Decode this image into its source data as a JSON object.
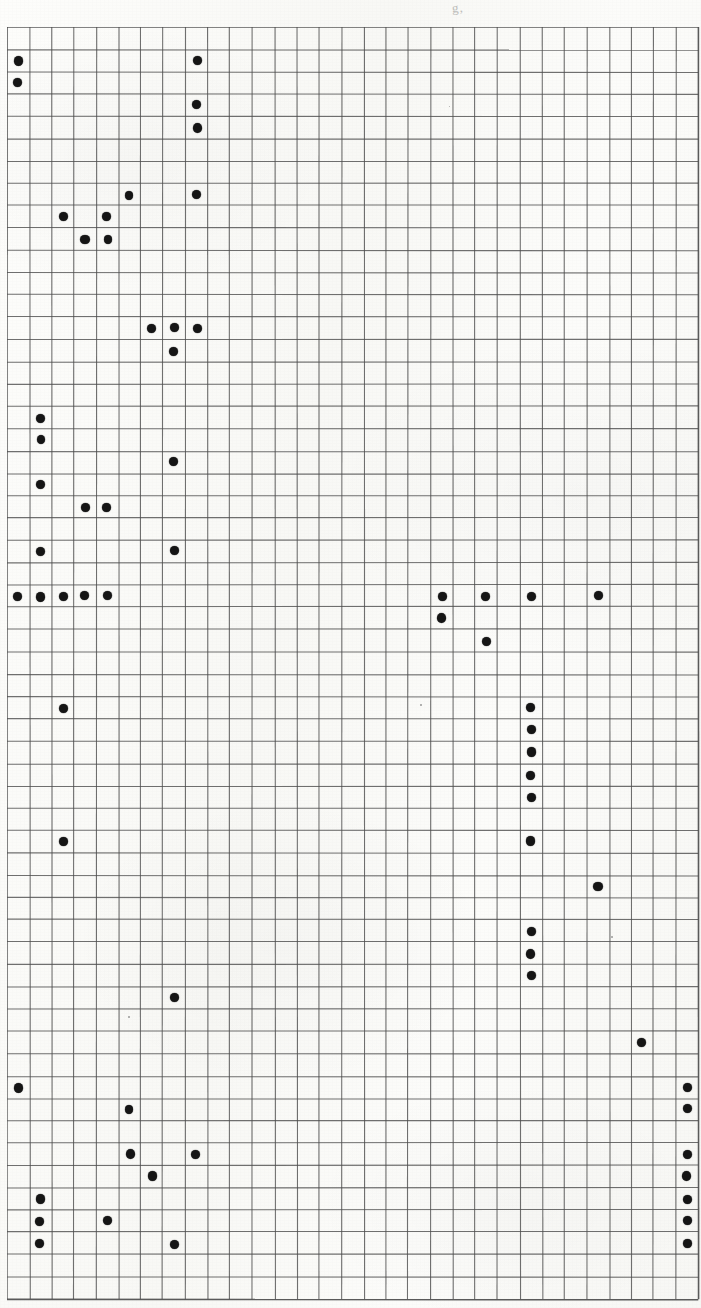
{
  "document": {
    "kind": "graph-paper-scan",
    "title": "",
    "top_smudge_text": "g,",
    "background_color": "#faf9f6",
    "ink_color": "#151515",
    "grid_line_color": "#4a4a4a"
  },
  "grid": {
    "origin_x": 7,
    "origin_y": 27,
    "cell_w": 22.3,
    "cell_h": 22.32,
    "cols": 31,
    "rows": 57,
    "line_color": "#4d4d4d",
    "line_width": 1.1
  },
  "chart_data": {
    "type": "scatter",
    "title": "",
    "subtitle": "",
    "xlabel": "",
    "ylabel": "",
    "grid": true,
    "legend": "none",
    "marker": "filled-circle",
    "marker_color": "#151515",
    "marker_radius_px": 4.4,
    "xlim": [
      0,
      31
    ],
    "ylim": [
      0,
      57
    ],
    "x_tick_labels": [],
    "y_tick_labels": [],
    "note": "Cell-indexed dot matrix. Each point is [column, row], 0-indexed from the top-left cell of the ruled grid.",
    "points": [
      [
        0,
        1
      ],
      [
        8,
        1
      ],
      [
        0,
        2
      ],
      [
        8,
        3
      ],
      [
        8,
        4
      ],
      [
        5,
        7
      ],
      [
        8,
        7
      ],
      [
        2,
        8
      ],
      [
        4,
        8
      ],
      [
        3,
        9
      ],
      [
        4,
        9
      ],
      [
        6,
        13
      ],
      [
        7,
        13
      ],
      [
        8,
        13
      ],
      [
        7,
        14
      ],
      [
        1,
        17
      ],
      [
        1,
        18
      ],
      [
        7,
        19
      ],
      [
        1,
        20
      ],
      [
        3,
        21
      ],
      [
        4,
        21
      ],
      [
        1,
        23
      ],
      [
        7,
        23
      ],
      [
        0,
        25
      ],
      [
        1,
        25
      ],
      [
        2,
        25
      ],
      [
        3,
        25
      ],
      [
        4,
        25
      ],
      [
        19,
        25
      ],
      [
        21,
        25
      ],
      [
        23,
        25
      ],
      [
        26,
        25
      ],
      [
        19,
        26
      ],
      [
        21,
        27
      ],
      [
        2,
        30
      ],
      [
        23,
        30
      ],
      [
        23,
        31
      ],
      [
        23,
        32
      ],
      [
        23,
        33
      ],
      [
        23,
        34
      ],
      [
        2,
        36
      ],
      [
        23,
        36
      ],
      [
        26,
        38
      ],
      [
        23,
        40
      ],
      [
        23,
        41
      ],
      [
        23,
        42
      ],
      [
        7,
        43
      ],
      [
        28,
        45
      ],
      [
        0,
        47
      ],
      [
        30,
        47
      ],
      [
        5,
        48
      ],
      [
        30,
        48
      ],
      [
        5,
        50
      ],
      [
        8,
        50
      ],
      [
        30,
        50
      ],
      [
        6,
        51
      ],
      [
        30,
        51
      ],
      [
        1,
        52
      ],
      [
        30,
        52
      ],
      [
        1,
        53
      ],
      [
        4,
        53
      ],
      [
        30,
        53
      ],
      [
        1,
        54
      ],
      [
        7,
        54
      ],
      [
        30,
        54
      ]
    ],
    "point_count": 66
  },
  "specks": [
    {
      "x": 128,
      "y": 1016,
      "d": 1.6
    },
    {
      "x": 611,
      "y": 936,
      "d": 1.6
    },
    {
      "x": 420,
      "y": 704,
      "d": 1.5
    },
    {
      "x": 449,
      "y": 106,
      "d": 1.4
    }
  ]
}
